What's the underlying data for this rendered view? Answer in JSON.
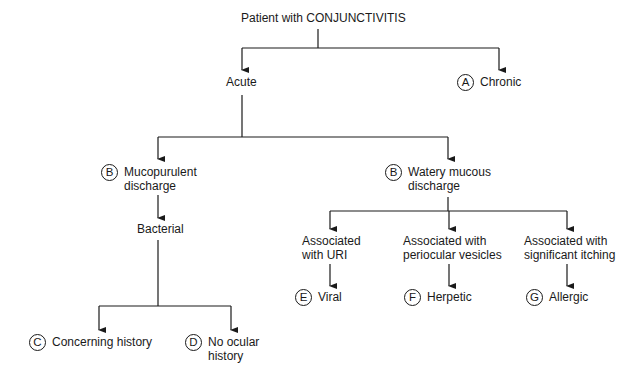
{
  "diagram": {
    "root": {
      "label": "Patient with CONJUNCTIVITIS"
    },
    "acute": {
      "label": "Acute"
    },
    "chronic": {
      "badge": "A",
      "label": "Chronic"
    },
    "mucopurulent": {
      "badge": "B",
      "line1": "Mucopurulent",
      "line2": "discharge"
    },
    "watery": {
      "badge": "B",
      "line1": "Watery mucous",
      "line2": "discharge"
    },
    "bacterial": {
      "label": "Bacterial"
    },
    "concerning": {
      "badge": "C",
      "label": "Concerning history"
    },
    "no_ocular": {
      "badge": "D",
      "line1": "No ocular",
      "line2": "history"
    },
    "uri": {
      "line1": "Associated",
      "line2": "with URI"
    },
    "periocular": {
      "line1": "Associated with",
      "line2": "periocular vesicles"
    },
    "itching": {
      "line1": "Associated with",
      "line2": "significant itching"
    },
    "viral": {
      "badge": "E",
      "label": "Viral"
    },
    "herpetic": {
      "badge": "F",
      "label": "Herpetic"
    },
    "allergic": {
      "badge": "G",
      "label": "Allergic"
    }
  },
  "colors": {
    "line": "#1a1a1a",
    "background": "#ffffff"
  }
}
